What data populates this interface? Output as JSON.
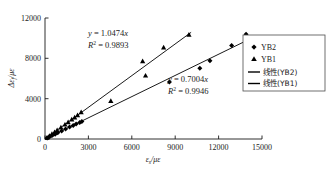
{
  "chart_data": {
    "type": "scatter",
    "title": "",
    "xlabel": "εs/με",
    "ylabel": "Δεf/με",
    "xlim": [
      0,
      15000
    ],
    "ylim": [
      0,
      12000
    ],
    "xticks": [
      "0",
      "3000",
      "6000",
      "9000",
      "12000",
      "15000"
    ],
    "yticks": [
      "0",
      "4000",
      "8000",
      "12000"
    ],
    "grid": false,
    "legend_position": "right",
    "series": [
      {
        "name": "YB2",
        "marker": "diamond",
        "color": "#000000",
        "points": [
          [
            150,
            95
          ],
          [
            320,
            215
          ],
          [
            520,
            360
          ],
          [
            700,
            480
          ],
          [
            880,
            610
          ],
          [
            1150,
            800
          ],
          [
            1420,
            990
          ],
          [
            1700,
            1180
          ],
          [
            1950,
            1340
          ],
          [
            2150,
            1490
          ],
          [
            2400,
            1640
          ],
          [
            2550,
            1730
          ],
          [
            8600,
            5650
          ],
          [
            10700,
            7020
          ],
          [
            11400,
            7770
          ],
          [
            12900,
            9280
          ],
          [
            13900,
            10380
          ]
        ]
      },
      {
        "name": "YB1",
        "marker": "triangle",
        "color": "#000000",
        "points": [
          [
            140,
            140
          ],
          [
            300,
            310
          ],
          [
            480,
            500
          ],
          [
            660,
            690
          ],
          [
            840,
            880
          ],
          [
            1100,
            1150
          ],
          [
            1380,
            1440
          ],
          [
            1600,
            1680
          ],
          [
            1850,
            1940
          ],
          [
            2050,
            2150
          ],
          [
            2250,
            2370
          ],
          [
            2500,
            2660
          ],
          [
            4550,
            3790
          ],
          [
            6750,
            7720
          ],
          [
            6950,
            6300
          ],
          [
            8200,
            9080
          ],
          [
            9950,
            10350
          ]
        ]
      }
    ],
    "trendlines": [
      {
        "name": "线性(YB2)",
        "for_series": "YB2",
        "slope": 0.7004,
        "intercept": 0,
        "equation": "y = 0.7004x",
        "r2_label": "R² = 0.9946",
        "r2_value": 0.9946,
        "x_start": 0,
        "x_end": 14300,
        "color": "#000000"
      },
      {
        "name": "线性(YB1)",
        "for_series": "YB1",
        "slope": 1.0474,
        "intercept": 0,
        "equation": "y = 1.0474x",
        "r2_label": "R² = 0.9893",
        "r2_value": 0.9893,
        "x_start": 0,
        "x_end": 10100,
        "color": "#000000"
      }
    ],
    "annotations": [
      {
        "id": "yb1-equation",
        "equation_y": "y",
        "equation_eq": " = 1.0474",
        "equation_x": "x",
        "r2_base": "R",
        "r2_sup": "2",
        "r2_value": " = 0.9893",
        "x_px": 88,
        "y_px": 34
      },
      {
        "id": "yb2-equation",
        "equation_y": "y",
        "equation_eq": " = 0.7004",
        "equation_x": "x",
        "r2_base": "R",
        "r2_sup": "2",
        "r2_value": " = 0.9946",
        "x_px": 168,
        "y_px": 80
      }
    ],
    "legend_entries": [
      {
        "label": "YB2",
        "symbol": "diamond",
        "kind": "marker"
      },
      {
        "label": "YB1",
        "symbol": "triangle",
        "kind": "marker"
      },
      {
        "label": "线性(YB2)",
        "symbol": "line",
        "kind": "line"
      },
      {
        "label": "线性(YB1)",
        "symbol": "line",
        "kind": "line"
      }
    ]
  },
  "axes": {
    "y_axis_title_delta": "Δ",
    "y_axis_title_eps": "ε",
    "y_axis_title_sub": "f",
    "y_axis_title_slash": "/",
    "y_axis_title_mu": "μ",
    "y_axis_title_eps2": "ε",
    "x_axis_title_eps": "ε",
    "x_axis_title_sub": "s",
    "x_axis_title_slash": "/",
    "x_axis_title_mu": "μ",
    "x_axis_title_eps2": "ε"
  },
  "colors": {
    "axis": "#1a1a1a",
    "marker": "#000000",
    "trendline": "#000000",
    "legend_border": "#4d4d4d",
    "background": "#ffffff"
  }
}
